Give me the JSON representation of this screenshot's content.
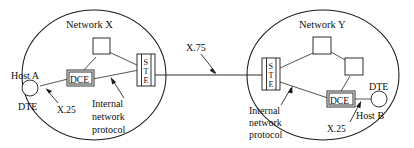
{
  "diagram": {
    "canvas": {
      "width": 414,
      "height": 148
    },
    "colors": {
      "background": "#ffffff",
      "stroke": "#1a1a1a",
      "text": "#111111"
    },
    "networks": [
      {
        "id": "network-x",
        "label": "Network X",
        "host_label": "Host A",
        "dte_label": "DTE",
        "dce_label": "DCE",
        "ste_label": "STE",
        "ste_letters": [
          "S",
          "T",
          "E"
        ],
        "x25_label": "X.25",
        "internal_protocol_lines": [
          "Internal",
          "network",
          "protocol"
        ],
        "switch_node_count": 1
      },
      {
        "id": "network-y",
        "label": "Network Y",
        "host_label": "Host B",
        "dte_label": "DTE",
        "dce_label": "DCE",
        "ste_label": "STE",
        "ste_letters": [
          "S",
          "T",
          "E"
        ],
        "x25_label": "X.25",
        "internal_protocol_lines": [
          "Internal",
          "network",
          "protocol"
        ],
        "switch_node_count": 2
      }
    ],
    "interconnect": {
      "label": "X.75",
      "description": "link between STE of Network X and STE of Network Y"
    }
  }
}
